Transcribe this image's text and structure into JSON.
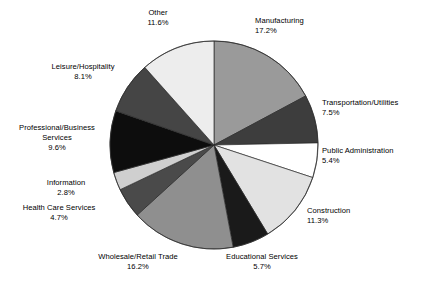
{
  "chart_data": {
    "type": "pie",
    "title": "",
    "subtitle": "",
    "xlabel": "",
    "ylabel": "",
    "legend_position": "none",
    "grid": false,
    "value_unit": "%",
    "start_angle_deg": 0,
    "direction": "clockwise",
    "categories": [
      "Manufacturing",
      "Transportation/Utilities",
      "Public Administration",
      "Construction",
      "Educational Services",
      "Wholesale/Retail Trade",
      "Health Care Services",
      "Information",
      "Professional/Business Services",
      "Leisure/Hospitality",
      "Other"
    ],
    "values": [
      17.2,
      7.5,
      5.4,
      11.3,
      5.7,
      16.2,
      4.7,
      2.8,
      9.6,
      8.1,
      11.6
    ],
    "colors": [
      "#9a9a9a",
      "#3d3d3d",
      "#ffffff",
      "#e2e2e2",
      "#1a1a1a",
      "#8f8f8f",
      "#4a4a4a",
      "#cfcfcf",
      "#0d0d0d",
      "#454545",
      "#ededed"
    ],
    "slices": [
      {
        "label": "Manufacturing",
        "value": 17.2,
        "value_text": "17.2%",
        "color": "#9a9a9a"
      },
      {
        "label": "Transportation/Utilities",
        "value": 7.5,
        "value_text": "7.5%",
        "color": "#3d3d3d"
      },
      {
        "label": "Public Administration",
        "value": 5.4,
        "value_text": "5.4%",
        "color": "#ffffff"
      },
      {
        "label": "Construction",
        "value": 11.3,
        "value_text": "11.3%",
        "color": "#e2e2e2"
      },
      {
        "label": "Educational Services",
        "value": 5.7,
        "value_text": "5.7%",
        "color": "#1a1a1a"
      },
      {
        "label": "Wholesale/Retail Trade",
        "value": 16.2,
        "value_text": "16.2%",
        "color": "#8f8f8f"
      },
      {
        "label": "Health Care Services",
        "value": 4.7,
        "value_text": "4.7%",
        "color": "#4a4a4a"
      },
      {
        "label": "Information",
        "value": 2.8,
        "value_text": "2.8%",
        "color": "#cfcfcf"
      },
      {
        "label": "Professional/Business Services",
        "value": 9.6,
        "value_text": "9.6%",
        "color": "#0d0d0d"
      },
      {
        "label": "Leisure/Hospitality",
        "value": 8.1,
        "value_text": "8.1%",
        "color": "#454545"
      },
      {
        "label": "Other",
        "value": 11.6,
        "value_text": "11.6%",
        "color": "#ededed"
      }
    ]
  },
  "labels": {
    "manufacturing": {
      "name": "Manufacturing",
      "value": "17.2%"
    },
    "transportation": {
      "name": "Transportation/Utilities",
      "value": "7.5%"
    },
    "public_admin": {
      "name": "Public Administration",
      "value": "5.4%"
    },
    "construction": {
      "name": "Construction",
      "value": "11.3%"
    },
    "educational": {
      "name": "Educational Services",
      "value": "5.7%"
    },
    "wholesale": {
      "name": "Wholesale/Retail Trade",
      "value": "16.2%"
    },
    "health_care": {
      "name": "Health Care Services",
      "value": "4.7%"
    },
    "information": {
      "name": "Information",
      "value": "2.8%"
    },
    "professional": {
      "name_line1": "Professional/Business",
      "name_line2": "Services",
      "value": "9.6%"
    },
    "leisure": {
      "name": "Leisure/Hospitality",
      "value": "8.1%"
    },
    "other": {
      "name": "Other",
      "value": "11.6%"
    }
  },
  "geometry": {
    "center_x": 214,
    "center_y": 145,
    "radius": 104,
    "stroke": "#2b2b2b",
    "stroke_width": 0.7
  }
}
